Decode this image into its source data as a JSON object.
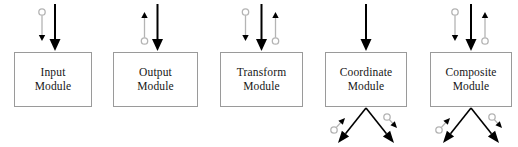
{
  "diagram": {
    "type": "module-flow-diagram",
    "background_color": "#ffffff",
    "box_border_color": "#9a9a9a",
    "primary_arrow_color": "#000000",
    "secondary_arrow_color": "#b4b4b4",
    "modules": [
      {
        "id": "input-module",
        "label_line1": "Input",
        "label_line2": "Module",
        "x": 14,
        "width": 78,
        "top_arrows": [
          {
            "name": "gray-down-arrow-circle-top",
            "style": "gray",
            "direction": "down",
            "marker": "circle-top",
            "offset": -11
          },
          {
            "name": "black-down-arrow",
            "style": "black",
            "direction": "down",
            "marker": "none",
            "offset": 2
          }
        ],
        "bottom_arrows": []
      },
      {
        "id": "output-module",
        "label_line1": "Output",
        "label_line2": "Module",
        "x": 113,
        "width": 85,
        "top_arrows": [
          {
            "name": "gray-up-arrow-circle-bottom",
            "style": "gray",
            "direction": "up",
            "marker": "circle-bottom",
            "offset": -11
          },
          {
            "name": "black-down-arrow",
            "style": "black",
            "direction": "down",
            "marker": "none",
            "offset": 2
          }
        ],
        "bottom_arrows": []
      },
      {
        "id": "transform-module",
        "label_line1": "Transform",
        "label_line2": "Module",
        "x": 220,
        "width": 83,
        "top_arrows": [
          {
            "name": "gray-down-arrow-circle-top",
            "style": "gray",
            "direction": "down",
            "marker": "circle-top",
            "offset": -16
          },
          {
            "name": "black-down-arrow",
            "style": "black",
            "direction": "down",
            "marker": "none",
            "offset": 0
          },
          {
            "name": "gray-up-arrow-circle-bottom",
            "style": "gray",
            "direction": "up",
            "marker": "circle-bottom",
            "offset": 14
          }
        ],
        "bottom_arrows": []
      },
      {
        "id": "coordinate-module",
        "label_line1": "Coordinate",
        "label_line2": "Module",
        "x": 325,
        "width": 82,
        "top_arrows": [
          {
            "name": "black-down-arrow",
            "style": "black",
            "direction": "down",
            "marker": "none",
            "offset": 0
          }
        ],
        "bottom_arrows": [
          {
            "name": "black-down-left-arrow",
            "style": "black",
            "direction": "down-left"
          },
          {
            "name": "black-down-right-arrow",
            "style": "black",
            "direction": "down-right"
          },
          {
            "name": "gray-up-right-arrow-circle",
            "style": "gray",
            "direction": "up-right",
            "marker": "circle-start"
          },
          {
            "name": "gray-down-right-arrow-circle",
            "style": "gray",
            "direction": "down-right",
            "marker": "circle-start"
          }
        ]
      },
      {
        "id": "composite-module",
        "label_line1": "Composite",
        "label_line2": "Module",
        "x": 430,
        "width": 82,
        "top_arrows": [
          {
            "name": "gray-down-arrow-circle-top",
            "style": "gray",
            "direction": "down",
            "marker": "circle-top",
            "offset": -16
          },
          {
            "name": "black-down-arrow",
            "style": "black",
            "direction": "down",
            "marker": "none",
            "offset": 0
          },
          {
            "name": "gray-up-arrow-circle-bottom",
            "style": "gray",
            "direction": "up",
            "marker": "circle-bottom",
            "offset": 14
          }
        ],
        "bottom_arrows": [
          {
            "name": "black-down-left-arrow",
            "style": "black",
            "direction": "down-left"
          },
          {
            "name": "black-down-right-arrow",
            "style": "black",
            "direction": "down-right"
          },
          {
            "name": "gray-up-right-arrow-circle",
            "style": "gray",
            "direction": "up-right",
            "marker": "circle-start"
          },
          {
            "name": "gray-down-right-arrow-circle",
            "style": "gray",
            "direction": "down-right",
            "marker": "circle-start"
          }
        ]
      }
    ]
  }
}
